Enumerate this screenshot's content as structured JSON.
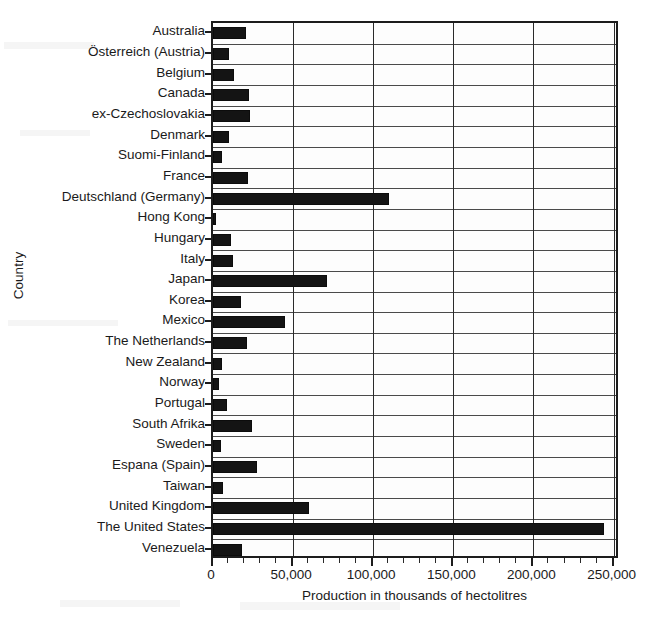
{
  "figure": {
    "title_partial": "",
    "background_color": "#ffffff",
    "bar_color": "#141414",
    "axis_color": "#1c1c1c"
  },
  "axes": {
    "y_axis_title": "Country",
    "x_axis_title": "Production in thousands of hectolitres",
    "x_tick_labels": [
      "0",
      "50,000",
      "100,000",
      "150,000",
      "200,000",
      "250,000"
    ],
    "x_tick_values": [
      0,
      50000,
      100000,
      150000,
      200000,
      250000
    ],
    "x_minor_step": 10000,
    "x_limits": [
      0,
      254000
    ],
    "grid": "vertical major gridlines plus horizontal category separators"
  },
  "chart_data": {
    "type": "bar",
    "orientation": "horizontal",
    "title": "",
    "xlabel": "Production in thousands of hectolitres",
    "ylabel": "Country",
    "xlim": [
      0,
      254000
    ],
    "grid": true,
    "legend": null,
    "categories": [
      "Australia",
      "Österreich (Austria)",
      "Belgium",
      "Canada",
      "ex-Czechoslovakia",
      "Denmark",
      "Suomi-Finland",
      "France",
      "Deutschland (Germany)",
      "Hong Kong",
      "Hungary",
      "Italy",
      "Japan",
      "Korea",
      "Mexico",
      "The Netherlands",
      "New Zealand",
      "Norway",
      "Portugal",
      "South Afrika",
      "Sweden",
      "Espana (Spain)",
      "Taiwan",
      "United Kingdom",
      "The United States",
      "Venezuela"
    ],
    "values": [
      20500,
      10000,
      13000,
      22500,
      23000,
      10000,
      5500,
      22000,
      110000,
      2000,
      11000,
      12500,
      71000,
      17500,
      45000,
      21000,
      5500,
      4000,
      8500,
      24500,
      5000,
      27500,
      6000,
      60000,
      244000,
      18000
    ]
  }
}
